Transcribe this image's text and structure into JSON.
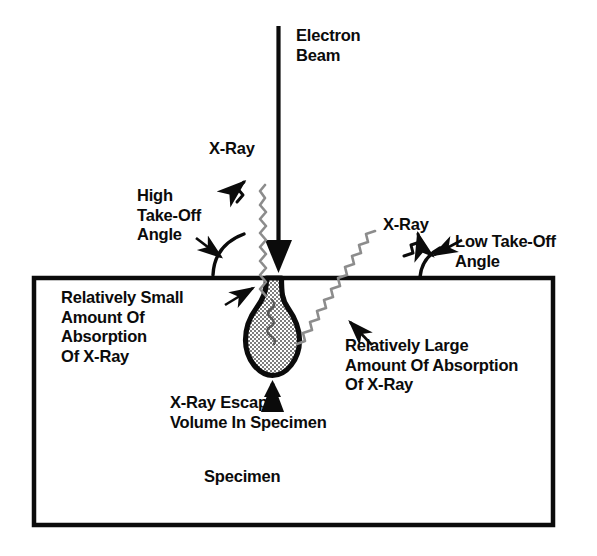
{
  "diagram": {
    "colors": {
      "ink": "#0b0b0b",
      "background": "#ffffff",
      "escape_volume_fill": "#a9a9a9",
      "escape_volume_outline": "#000000",
      "xray_line": "#6f6f6f"
    },
    "labels": {
      "electron_beam": "Electron\nBeam",
      "xray_left": "X-Ray",
      "high_take_off_angle": "High\nTake-Off\nAngle",
      "relatively_small_absorption": "Relatively Small\nAmount Of\nAbsorption\nOf X-Ray",
      "xray_right": "X-Ray",
      "low_take_off_angle": "Low Take-Off\nAngle",
      "relatively_large_absorption": "Relatively Large\nAmount Of Absorption\nOf X-Ray",
      "xray_escape_volume": "X-Ray Escape\nVolume In Specimen",
      "specimen": "Specimen"
    },
    "parts": {
      "electron_beam_arrow": "electron-beam-arrow",
      "specimen_box": "specimen-box",
      "escape_volume": "x-ray-escape-volume",
      "xray_high_angle_path": "x-ray-high-take-off-path",
      "xray_low_angle_path": "x-ray-low-take-off-path",
      "high_angle_arc": "high-take-off-angle-arc",
      "low_angle_arc": "low-take-off-angle-arc"
    }
  }
}
